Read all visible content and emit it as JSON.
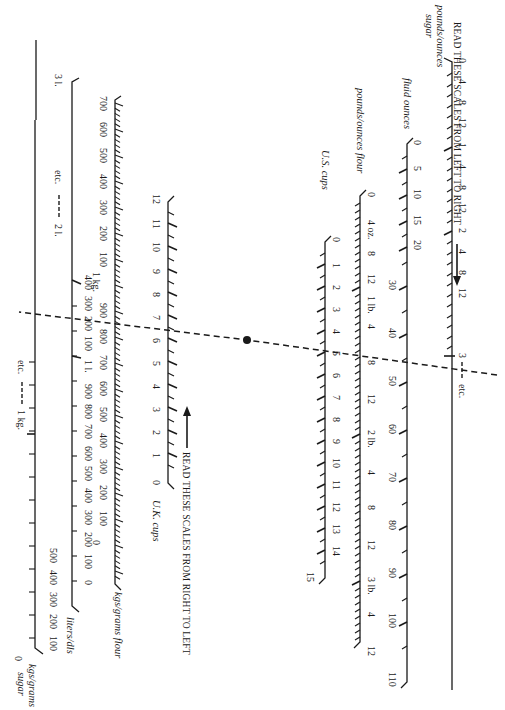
{
  "headers": {
    "top": "READ THESE SCALES FROM LEFT TO RIGHT",
    "bottom": "READ THESE SCALES FROM RIGHT TO LEFT"
  },
  "scales": {
    "sugar_lb": {
      "title_line1": "pounds/ounces",
      "title_line2": "sugar",
      "labels": [
        "0",
        "4",
        "8",
        "12",
        "1",
        "4",
        "8",
        "12",
        "2",
        "4",
        "8",
        "12",
        "3"
      ],
      "etc": "etc."
    },
    "fluid_oz": {
      "title": "fluid ounces",
      "labels": [
        "0",
        "5",
        "10",
        "15",
        "20",
        "30",
        "40",
        "50",
        "60",
        "70",
        "80",
        "90",
        "100",
        "110"
      ]
    },
    "flour_lb": {
      "title": "pounds/ounces flour",
      "labels": [
        "0",
        "4 oz.",
        "8",
        "12",
        "1 lb.",
        "4",
        "8",
        "12",
        "2 lb.",
        "4",
        "8",
        "12",
        "3 lb.",
        "4",
        "8",
        "12"
      ]
    },
    "us_cups": {
      "title": "U.S. cups",
      "labels": [
        "0",
        "1",
        "2",
        "3",
        "4",
        "5",
        "6",
        "7",
        "8",
        "9",
        "10",
        "11",
        "12",
        "13",
        "14",
        "15"
      ]
    },
    "uk_cups": {
      "title": "U.K. cups",
      "labels": [
        "12",
        "11",
        "10",
        "9",
        "8",
        "7",
        "6",
        "5",
        "4",
        "3",
        "2",
        "1",
        "0"
      ]
    },
    "flour_kg": {
      "title": "kgs/grams flour",
      "labels": [
        "700",
        "600",
        "500",
        "400",
        "300",
        "200",
        "100",
        "1 kg.",
        "900",
        "800",
        "700",
        "600",
        "500",
        "400",
        "300",
        "200",
        "100",
        "0"
      ]
    },
    "liters": {
      "title": "liters/dls",
      "label_3l": "3 l.",
      "label_2l": "2 l.",
      "etc": "etc.",
      "labels": [
        "400",
        "300",
        "200",
        "100",
        "1 l.",
        "900",
        "800",
        "700",
        "600",
        "500",
        "400",
        "300",
        "200",
        "100",
        "0"
      ]
    },
    "sugar_kg": {
      "title_line1": "kgs/grams",
      "title_line2": "sugar",
      "etc": "etc.",
      "label_1kg": "1 kg.",
      "labels": [
        "500",
        "400",
        "300",
        "200",
        "100",
        "0"
      ]
    }
  },
  "example": {
    "description": "Dashed line: 8 oz sugar (1 lb 8 oz) through pivot reads ~40 fl oz, 4 lb flour, 5 US cups, 4 UK cups"
  }
}
